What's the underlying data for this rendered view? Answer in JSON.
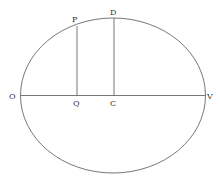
{
  "diagram": {
    "type": "ellipse-geometry",
    "stroke_color": "#555555",
    "labels": {
      "P": "P",
      "D": "D",
      "O": "O",
      "Q": "Q",
      "C": "C",
      "V": "V"
    }
  }
}
